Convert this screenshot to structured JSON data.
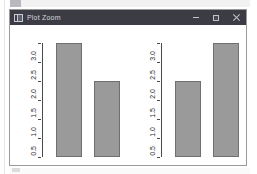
{
  "window": {
    "title": "Plot Zoom",
    "app_icon": "plot-window-icon",
    "controls": {
      "minimize": "–",
      "maximize": "□",
      "close": "✕"
    }
  },
  "chart_data": [
    {
      "type": "bar",
      "panel": "left",
      "title": "",
      "xlabel": "",
      "ylabel": "",
      "categories": [
        "man",
        "woman"
      ],
      "values": [
        3.0,
        2.0
      ],
      "ylim": [
        0.0,
        3.0
      ],
      "yticks": [
        0.0,
        0.5,
        1.0,
        1.5,
        2.0,
        2.5,
        3.0
      ],
      "ytick_labels": [
        "0.0",
        "0.5",
        "1.0",
        "1.5",
        "2.0",
        "2.5",
        "3.0"
      ],
      "grid": false,
      "legend": false,
      "bar_fill": "#9a9a9a",
      "bar_border": "#6f6f6f"
    },
    {
      "type": "bar",
      "panel": "right",
      "title": "",
      "xlabel": "",
      "ylabel": "",
      "categories": [
        "woman",
        "man"
      ],
      "values": [
        2.0,
        3.0
      ],
      "ylim": [
        0.0,
        3.0
      ],
      "yticks": [
        0.0,
        0.5,
        1.0,
        1.5,
        2.0,
        2.5,
        3.0
      ],
      "ytick_labels": [
        "0.0",
        "0.5",
        "1.0",
        "1.5",
        "2.0",
        "2.5",
        "3.0"
      ],
      "grid": false,
      "legend": false,
      "bar_fill": "#9a9a9a",
      "bar_border": "#6f6f6f"
    }
  ],
  "colors": {
    "titlebar": "#3c3c44",
    "titlebar_text": "#d7d7dc",
    "canvas": "#ffffff",
    "axis": "#4a4a4a",
    "bar_fill": "#9a9a9a",
    "bar_border": "#6f6f6f"
  }
}
